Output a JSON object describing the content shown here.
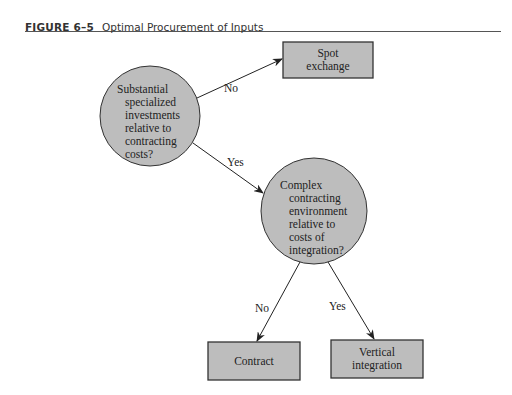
{
  "figure": {
    "label": "FIGURE 6–5",
    "title": "Optimal Procurement of Inputs"
  },
  "nodes": {
    "decision1": {
      "lines": [
        "Substantial",
        "specialized",
        "investments",
        "relative to",
        "contracting",
        "costs?"
      ]
    },
    "decision2": {
      "lines": [
        "Complex",
        "contracting",
        "environment",
        "relative to",
        "costs of",
        "integration?"
      ]
    },
    "spot": {
      "line1": "Spot",
      "line2": "exchange"
    },
    "contract": {
      "label": "Contract"
    },
    "vertical": {
      "line1": "Vertical",
      "line2": "integration"
    }
  },
  "edges": {
    "d1_no": "No",
    "d1_yes": "Yes",
    "d2_no": "No",
    "d2_yes": "Yes"
  },
  "colors": {
    "fill": "#bdbdbd",
    "stroke": "#333333"
  }
}
